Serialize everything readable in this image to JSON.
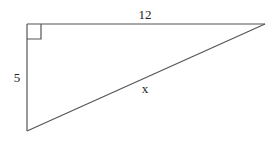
{
  "diagram": {
    "type": "right-triangle",
    "stroke_color": "#555555",
    "labels": {
      "top_side": "12",
      "left_side": "5",
      "hypotenuse": "x"
    },
    "right_angle_marker": true
  }
}
